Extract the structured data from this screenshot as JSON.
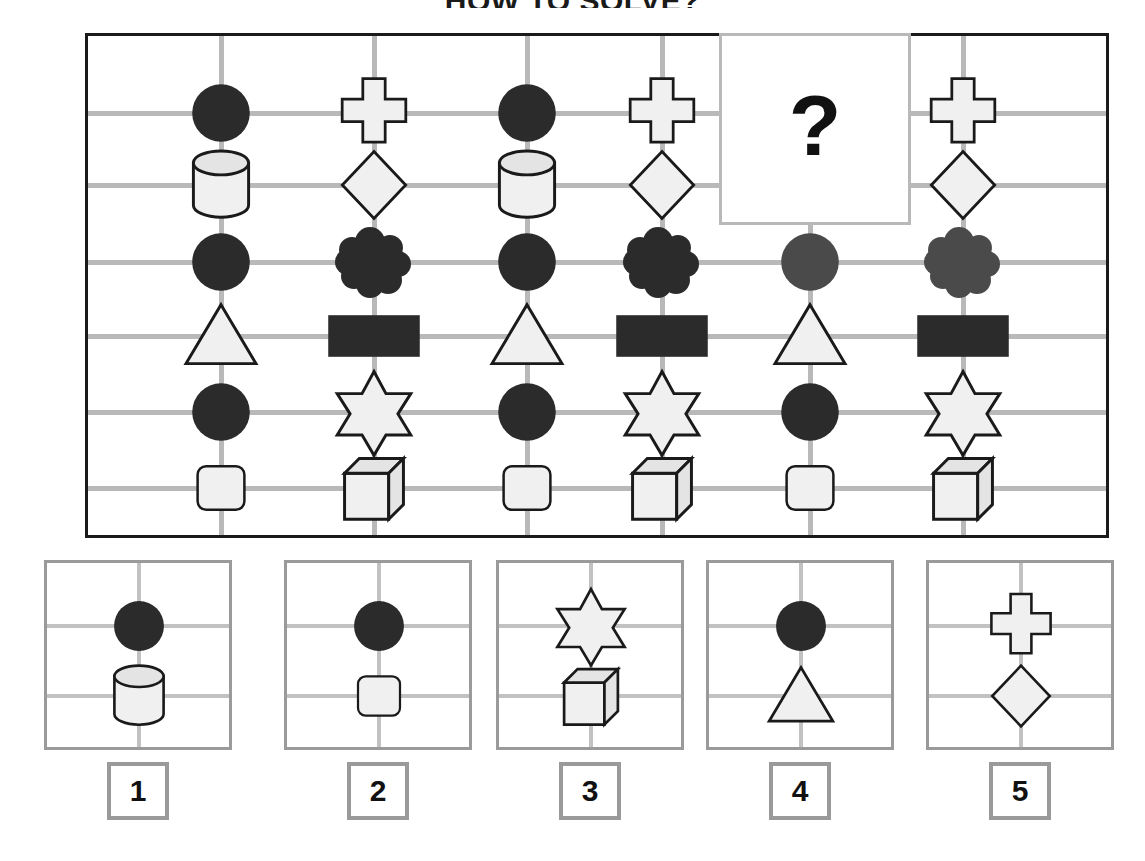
{
  "title": "HOW TO SOLVE?",
  "question_mark": "?",
  "colors": {
    "ink": "#1a1a1a",
    "grid_line": "#b9b9b9",
    "option_border": "#9a9a9a",
    "fill_dark": "#2b2b2b",
    "fill_dark_gray": "#4a4a4a",
    "fill_light": "#f0f0f0",
    "fill_light_top": "#e4e4e4"
  },
  "matrix": {
    "rows": 6,
    "columns": 6,
    "missing_cell": {
      "column": 5,
      "rows": [
        1,
        2
      ],
      "label": "?"
    },
    "cells": [
      {
        "col": 1,
        "row": 1,
        "shape": "circle",
        "tone": "dark"
      },
      {
        "col": 1,
        "row": 2,
        "shape": "cylinder",
        "tone": "light"
      },
      {
        "col": 1,
        "row": 3,
        "shape": "circle",
        "tone": "dark"
      },
      {
        "col": 1,
        "row": 4,
        "shape": "triangle",
        "tone": "light"
      },
      {
        "col": 1,
        "row": 5,
        "shape": "circle",
        "tone": "dark"
      },
      {
        "col": 1,
        "row": 6,
        "shape": "rounded-square",
        "tone": "light"
      },
      {
        "col": 2,
        "row": 1,
        "shape": "cross",
        "tone": "light"
      },
      {
        "col": 2,
        "row": 2,
        "shape": "diamond",
        "tone": "light"
      },
      {
        "col": 2,
        "row": 3,
        "shape": "cloud",
        "tone": "dark"
      },
      {
        "col": 2,
        "row": 4,
        "shape": "rectangle",
        "tone": "dark"
      },
      {
        "col": 2,
        "row": 5,
        "shape": "star6",
        "tone": "light"
      },
      {
        "col": 2,
        "row": 6,
        "shape": "cube",
        "tone": "light"
      },
      {
        "col": 3,
        "row": 1,
        "shape": "circle",
        "tone": "dark"
      },
      {
        "col": 3,
        "row": 2,
        "shape": "cylinder",
        "tone": "light"
      },
      {
        "col": 3,
        "row": 3,
        "shape": "circle",
        "tone": "dark"
      },
      {
        "col": 3,
        "row": 4,
        "shape": "triangle",
        "tone": "light"
      },
      {
        "col": 3,
        "row": 5,
        "shape": "circle",
        "tone": "dark"
      },
      {
        "col": 3,
        "row": 6,
        "shape": "rounded-square",
        "tone": "light"
      },
      {
        "col": 4,
        "row": 1,
        "shape": "cross",
        "tone": "light"
      },
      {
        "col": 4,
        "row": 2,
        "shape": "diamond",
        "tone": "light"
      },
      {
        "col": 4,
        "row": 3,
        "shape": "cloud",
        "tone": "dark"
      },
      {
        "col": 4,
        "row": 4,
        "shape": "rectangle",
        "tone": "dark"
      },
      {
        "col": 4,
        "row": 5,
        "shape": "star6",
        "tone": "light"
      },
      {
        "col": 4,
        "row": 6,
        "shape": "cube",
        "tone": "light"
      },
      {
        "col": 5,
        "row": 3,
        "shape": "circle",
        "tone": "dark-gray"
      },
      {
        "col": 5,
        "row": 4,
        "shape": "triangle",
        "tone": "light"
      },
      {
        "col": 5,
        "row": 5,
        "shape": "circle",
        "tone": "dark"
      },
      {
        "col": 5,
        "row": 6,
        "shape": "rounded-square",
        "tone": "light"
      },
      {
        "col": 6,
        "row": 1,
        "shape": "cross",
        "tone": "light"
      },
      {
        "col": 6,
        "row": 2,
        "shape": "diamond",
        "tone": "light"
      },
      {
        "col": 6,
        "row": 3,
        "shape": "cloud",
        "tone": "dark-gray"
      },
      {
        "col": 6,
        "row": 4,
        "shape": "rectangle",
        "tone": "dark"
      },
      {
        "col": 6,
        "row": 5,
        "shape": "star6",
        "tone": "light"
      },
      {
        "col": 6,
        "row": 6,
        "shape": "cube",
        "tone": "light"
      }
    ]
  },
  "options": [
    {
      "label": "1",
      "shapes": [
        {
          "slot": "top",
          "shape": "circle",
          "tone": "dark"
        },
        {
          "slot": "bottom",
          "shape": "cylinder",
          "tone": "light"
        }
      ]
    },
    {
      "label": "2",
      "shapes": [
        {
          "slot": "top",
          "shape": "circle",
          "tone": "dark"
        },
        {
          "slot": "bottom",
          "shape": "rounded-square",
          "tone": "light"
        }
      ]
    },
    {
      "label": "3",
      "shapes": [
        {
          "slot": "top",
          "shape": "star6",
          "tone": "light"
        },
        {
          "slot": "bottom",
          "shape": "cube",
          "tone": "light"
        }
      ]
    },
    {
      "label": "4",
      "shapes": [
        {
          "slot": "top",
          "shape": "circle",
          "tone": "dark"
        },
        {
          "slot": "bottom",
          "shape": "triangle",
          "tone": "light"
        }
      ]
    },
    {
      "label": "5",
      "shapes": [
        {
          "slot": "top",
          "shape": "cross",
          "tone": "light"
        },
        {
          "slot": "bottom",
          "shape": "diamond",
          "tone": "light"
        }
      ]
    }
  ]
}
